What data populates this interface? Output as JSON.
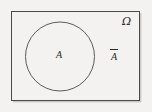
{
  "figure": {
    "kind": "venn-diagram",
    "background_color": "#f3f2f0",
    "stroke_color": "#555555",
    "text_color": "#2b2b2b"
  },
  "universe": {
    "label": "Ω",
    "shape": "rectangle"
  },
  "set_a": {
    "label": "A",
    "shape": "circle"
  },
  "complement": {
    "overbar": "",
    "label": "A"
  }
}
